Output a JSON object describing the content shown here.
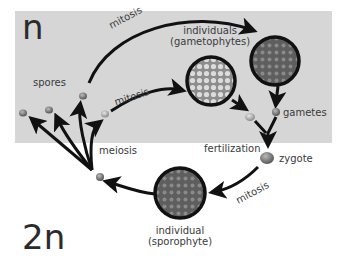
{
  "diagram": {
    "zones": {
      "haploid": {
        "label": "n",
        "background": "#d6d6d6"
      },
      "diploid": {
        "label": "2n",
        "background": "#ffffff"
      }
    },
    "nodes": {
      "spores": {
        "label": "spores"
      },
      "gametophytes": {
        "label_line1": "individuals",
        "label_line2": "(gametophytes)"
      },
      "gametes": {
        "label": "gametes"
      },
      "zygote": {
        "label": "zygote"
      },
      "sporophyte": {
        "label_line1": "individual",
        "label_line2": "(sporophyte)"
      }
    },
    "processes": {
      "mitosis_upper": "mitosis",
      "mitosis_lower": "mitosis",
      "fertilization": "fertilization",
      "mitosis_diploid": "mitosis",
      "meiosis": "meiosis"
    },
    "edges": [
      {
        "from": "spore",
        "to": "gametophyte-dark",
        "label": "mitosis"
      },
      {
        "from": "spore",
        "to": "gametophyte-light",
        "label": "mitosis"
      },
      {
        "from": "gametophyte-dark",
        "to": "gamete-dark"
      },
      {
        "from": "gametophyte-light",
        "to": "gamete-light"
      },
      {
        "from": "gametes",
        "to": "zygote",
        "label": "fertilization"
      },
      {
        "from": "zygote",
        "to": "sporophyte",
        "label": "mitosis"
      },
      {
        "from": "sporophyte",
        "to": "meiocyte"
      },
      {
        "from": "meiocyte",
        "to": "spores",
        "label": "meiosis"
      }
    ],
    "colors": {
      "line": "#111111",
      "text": "#3a3a3a",
      "cell_dark": "#6b6b6b",
      "cell_light": "#b4b4b4",
      "cell_sporophyte": "#6e6e6e"
    }
  }
}
